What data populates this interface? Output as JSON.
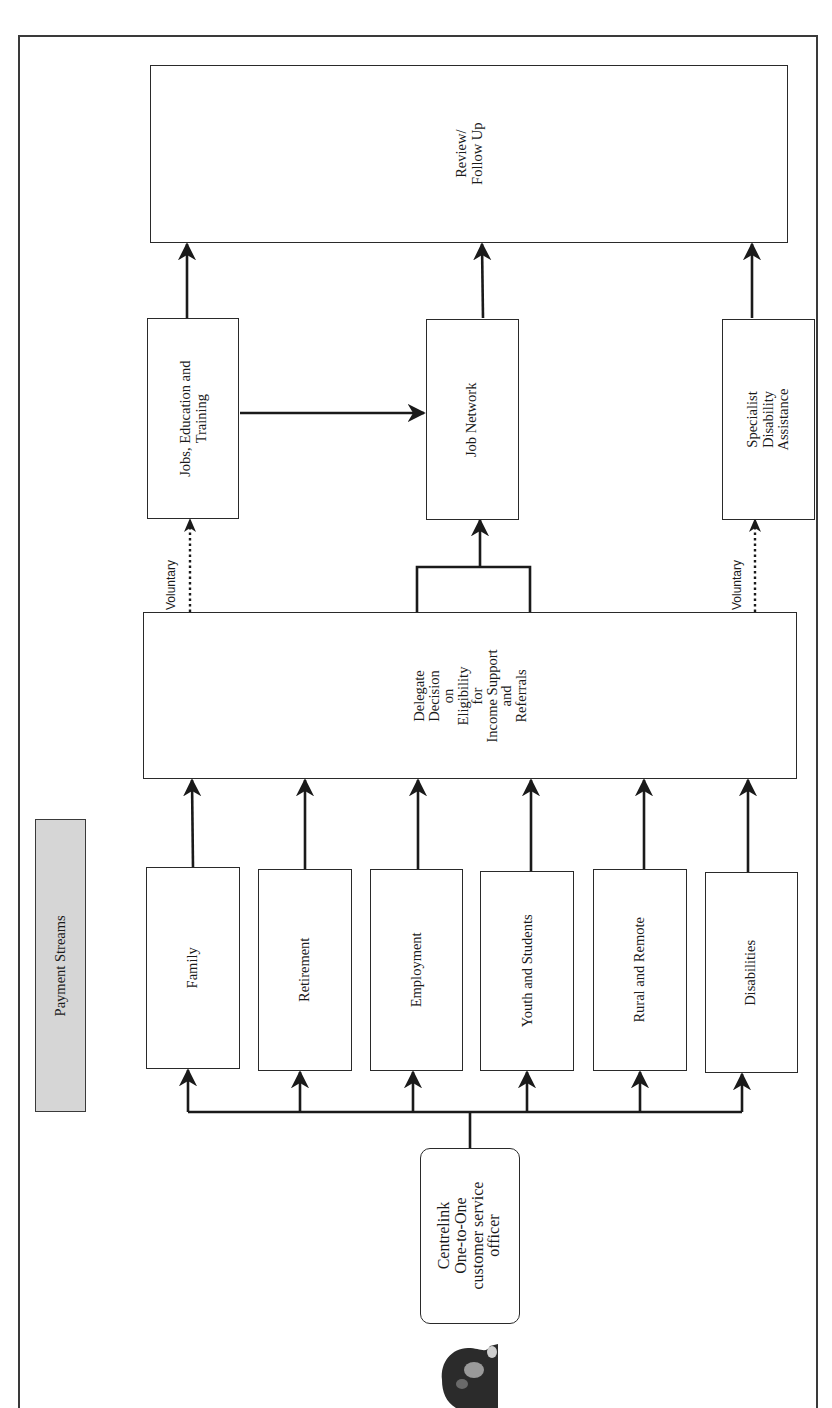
{
  "diagram": {
    "title_box": {
      "label": "Payment Streams",
      "fill": "#d6d6d6"
    },
    "review": {
      "lines": [
        "Review/",
        "Follow Up"
      ]
    },
    "services": [
      {
        "id": "jet",
        "lines": [
          "Jobs, Education and",
          "Training"
        ]
      },
      {
        "id": "job-network",
        "lines": [
          "Job Network"
        ]
      },
      {
        "id": "sda",
        "lines": [
          "Specialist",
          "Disability",
          "Assistance"
        ]
      }
    ],
    "delegate": {
      "lines": [
        "Delegate",
        "Decision",
        "on",
        "Eligibility",
        "for",
        "Income Support",
        "and",
        "Referrals"
      ]
    },
    "streams": [
      {
        "label": "Family"
      },
      {
        "label": "Retirement"
      },
      {
        "label": "Employment"
      },
      {
        "label": "Youth and Students"
      },
      {
        "label": "Rural and Remote"
      },
      {
        "label": "Disabilities"
      }
    ],
    "officer": {
      "lines": [
        "Centrelink",
        "One-to-One",
        "customer service",
        "officer"
      ]
    },
    "voluntary_labels": [
      "Voluntary",
      "Voluntary"
    ],
    "edges": [
      {
        "from": "officer",
        "to": "streams",
        "style": "solid"
      },
      {
        "from": "Family",
        "to": "delegate",
        "style": "solid"
      },
      {
        "from": "Retirement",
        "to": "delegate",
        "style": "solid"
      },
      {
        "from": "Employment",
        "to": "delegate",
        "style": "solid"
      },
      {
        "from": "Youth and Students",
        "to": "delegate",
        "style": "solid"
      },
      {
        "from": "Rural and Remote",
        "to": "delegate",
        "style": "solid"
      },
      {
        "from": "Disabilities",
        "to": "delegate",
        "style": "solid"
      },
      {
        "from": "delegate",
        "to": "Job Network",
        "style": "solid"
      },
      {
        "from": "delegate",
        "to": "Jobs, Education and Training",
        "style": "dotted",
        "label": "Voluntary"
      },
      {
        "from": "delegate",
        "to": "Specialist Disability Assistance",
        "style": "dotted",
        "label": "Voluntary"
      },
      {
        "from": "Jobs, Education and Training",
        "to": "Job Network",
        "style": "solid"
      },
      {
        "from": "Jobs, Education and Training",
        "to": "review",
        "style": "solid"
      },
      {
        "from": "Job Network",
        "to": "review",
        "style": "solid"
      },
      {
        "from": "Specialist Disability Assistance",
        "to": "review",
        "style": "solid"
      }
    ]
  }
}
